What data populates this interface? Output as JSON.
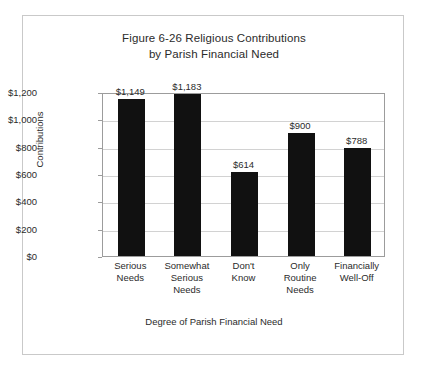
{
  "figure": {
    "title_line1": "Figure 6-26 Religious Contributions",
    "title_line2": "by Parish Financial Need",
    "border_color": "#c9c9c9",
    "background": "#ffffff"
  },
  "chart_data": {
    "type": "bar",
    "title": "Figure 6-26 Religious Contributions by Parish Financial Need",
    "xlabel": "Degree of Parish Financial Need",
    "ylabel": "Contributions",
    "ylim": [
      0,
      1200
    ],
    "grid": true,
    "legend": "none",
    "bar_color": "#111111",
    "categories": [
      "Serious Needs",
      "Somewhat Serious Needs",
      "Don't Know",
      "Only Routine Needs",
      "Financially Well-Off"
    ],
    "category_label_lines": [
      [
        "Serious",
        "Needs"
      ],
      [
        "Somewhat",
        "Serious",
        "Needs"
      ],
      [
        "Don't",
        "Know"
      ],
      [
        "Only",
        "Routine",
        "Needs"
      ],
      [
        "Financially",
        "Well-Off"
      ]
    ],
    "values": [
      1149,
      1183,
      614,
      900,
      788
    ],
    "value_labels": [
      "$1,149",
      "$1,183",
      "$614",
      "$900",
      "$788"
    ],
    "ytick_values": [
      0,
      200,
      400,
      600,
      800,
      1000,
      1200
    ],
    "ytick_labels": [
      "$0",
      "$200",
      "$400",
      "$600",
      "$800",
      "$1,000",
      "$1,200"
    ]
  }
}
